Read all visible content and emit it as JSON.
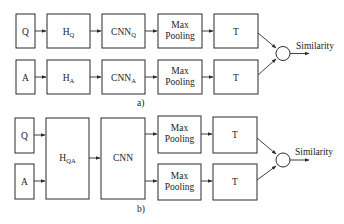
{
  "diagram_a": {
    "caption": "a)",
    "rows": [
      {
        "input": "Q",
        "encoder": {
          "base": "H",
          "sub": "Q"
        },
        "cnn": {
          "base": "CNN",
          "sub": "Q"
        },
        "pool_line1": "Max",
        "pool_line2": "Pooling",
        "transform": "T"
      },
      {
        "input": "A",
        "encoder": {
          "base": "H",
          "sub": "A"
        },
        "cnn": {
          "base": "CNN",
          "sub": "A"
        },
        "pool_line1": "Max",
        "pool_line2": "Pooling",
        "transform": "T"
      }
    ],
    "output": "Similarity"
  },
  "diagram_b": {
    "caption": "b)",
    "inputs": [
      "Q",
      "A"
    ],
    "encoder": {
      "base": "H",
      "sub": "QA"
    },
    "cnn": "CNN",
    "rows": [
      {
        "pool_line1": "Max",
        "pool_line2": "Pooling",
        "transform": "T"
      },
      {
        "pool_line1": "Max",
        "pool_line2": "Pooling",
        "transform": "T"
      }
    ],
    "output": "Similarity"
  }
}
